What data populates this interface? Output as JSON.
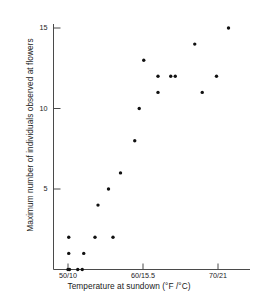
{
  "chart_data": {
    "type": "scatter",
    "title": "",
    "xlabel": "Temperature at sundown (°F /°C)",
    "ylabel": "Maximum number of individuals observed at flowers",
    "xlim": [
      48.5,
      74.0
    ],
    "ylim": [
      0,
      16.2
    ],
    "grid": false,
    "legend": null,
    "xtick_labels": [
      "50/10",
      "60/15.5",
      "70/21"
    ],
    "xtick_values": [
      50,
      60,
      70
    ],
    "ytick_labels": [
      "5",
      "10",
      "15"
    ],
    "ytick_values": [
      5,
      10,
      15
    ],
    "marker": {
      "shape": "circle",
      "color": "#111111",
      "size_px": 3.4
    },
    "axis_color": "#4a4a4a",
    "points": [
      {
        "x": 50.0,
        "y": 0
      },
      {
        "x": 50.2,
        "y": 0
      },
      {
        "x": 51.3,
        "y": 0
      },
      {
        "x": 51.9,
        "y": 0
      },
      {
        "x": 50.1,
        "y": 1
      },
      {
        "x": 52.1,
        "y": 1
      },
      {
        "x": 50.1,
        "y": 2
      },
      {
        "x": 53.6,
        "y": 2
      },
      {
        "x": 56.0,
        "y": 2
      },
      {
        "x": 54.0,
        "y": 4
      },
      {
        "x": 55.4,
        "y": 5
      },
      {
        "x": 57.0,
        "y": 6
      },
      {
        "x": 58.9,
        "y": 8
      },
      {
        "x": 59.5,
        "y": 10
      },
      {
        "x": 60.1,
        "y": 13
      },
      {
        "x": 62.0,
        "y": 12
      },
      {
        "x": 62.0,
        "y": 11
      },
      {
        "x": 63.7,
        "y": 12
      },
      {
        "x": 64.3,
        "y": 12
      },
      {
        "x": 66.9,
        "y": 14
      },
      {
        "x": 67.9,
        "y": 11
      },
      {
        "x": 69.8,
        "y": 12
      },
      {
        "x": 71.4,
        "y": 15
      }
    ]
  },
  "axes": {
    "x_axis_name": "x-axis",
    "y_axis_name": "y-axis"
  }
}
